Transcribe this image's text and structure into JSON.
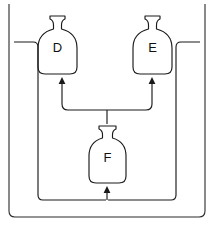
{
  "diagram": {
    "type": "process-flow",
    "background_color": "#ffffff",
    "line_color": "#1a1a1a",
    "frame_color": "#2b2b2b",
    "vessels": [
      {
        "id": "D",
        "label": "D",
        "position": "top-left",
        "icon": "bottle-icon",
        "x": 56,
        "y": 45
      },
      {
        "id": "E",
        "label": "E",
        "position": "top-right",
        "icon": "bottle-icon",
        "x": 152,
        "y": 45
      },
      {
        "id": "F",
        "label": "F",
        "position": "bottom-center",
        "icon": "bottle-icon",
        "x": 108,
        "y": 158
      }
    ],
    "connectors": [
      {
        "name": "f-to-d-branch",
        "from": "F",
        "to": "D",
        "arrow": "up",
        "style": "solid"
      },
      {
        "name": "f-to-e-branch",
        "from": "F",
        "to": "E",
        "arrow": "up",
        "style": "solid"
      },
      {
        "name": "d-return-loop",
        "from": "D",
        "to": "F",
        "arrow": "up",
        "style": "solid"
      },
      {
        "name": "e-return-loop",
        "from": "E",
        "to": "F",
        "arrow": "up",
        "style": "solid"
      }
    ],
    "arrow_count": 3
  }
}
